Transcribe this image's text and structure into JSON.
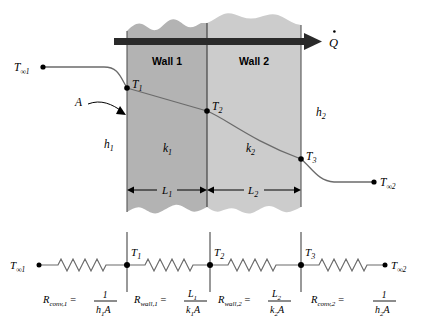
{
  "figure": {
    "type": "thermal-resistance-diagram",
    "heat_flow_symbol": "Q",
    "area_label": "A"
  },
  "walls": {
    "wall1": {
      "name": "Wall 1",
      "conductivity_label": "k",
      "conductivity_sub": "1",
      "thickness_label": "L",
      "thickness_sub": "1",
      "fill": "#b3b3b3"
    },
    "wall2": {
      "name": "Wall 2",
      "conductivity_label": "k",
      "conductivity_sub": "2",
      "thickness_label": "L",
      "thickness_sub": "2",
      "fill": "#cccccc"
    }
  },
  "convection": {
    "left": {
      "h_label": "h",
      "h_sub": "1"
    },
    "right": {
      "h_label": "h",
      "h_sub": "2"
    }
  },
  "temperatures": {
    "t_inf1": {
      "base": "T",
      "sub": "∞1"
    },
    "t1": {
      "base": "T",
      "sub": "1"
    },
    "t2": {
      "base": "T",
      "sub": "2"
    },
    "t3": {
      "base": "T",
      "sub": "3"
    },
    "t_inf2": {
      "base": "T",
      "sub": "∞2"
    }
  },
  "network": {
    "nodes": [
      {
        "id": "t_inf1",
        "base": "T",
        "sub": "∞1"
      },
      {
        "id": "t1",
        "base": "T",
        "sub": "1"
      },
      {
        "id": "t2",
        "base": "T",
        "sub": "2"
      },
      {
        "id": "t3",
        "base": "T",
        "sub": "3"
      },
      {
        "id": "t_inf2",
        "base": "T",
        "sub": "∞2"
      }
    ],
    "resistors": [
      {
        "id": "r-conv-1",
        "symbol": "R",
        "symbol_sub": "conv,1",
        "equals": "=",
        "numerator": "1",
        "denominator_base": "h",
        "denominator_sub": "1",
        "denominator_tail": "A"
      },
      {
        "id": "r-wall-1",
        "symbol": "R",
        "symbol_sub": "wall,1",
        "equals": "=",
        "numerator": "L",
        "numerator_sub": "1",
        "denominator_base": "k",
        "denominator_sub": "1",
        "denominator_tail": "A"
      },
      {
        "id": "r-wall-2",
        "symbol": "R",
        "symbol_sub": "wall,2",
        "equals": "=",
        "numerator": "L",
        "numerator_sub": "2",
        "denominator_base": "k",
        "denominator_sub": "2",
        "denominator_tail": "A"
      },
      {
        "id": "r-conv-2",
        "symbol": "R",
        "symbol_sub": "conv,2",
        "equals": "=",
        "numerator": "1",
        "denominator_base": "h",
        "denominator_sub": "2",
        "denominator_tail": "A"
      }
    ]
  },
  "colors": {
    "wall1": "#b3b3b3",
    "wall2": "#cccccc",
    "arrow": "#2a2a2a",
    "line": "#6b6b6b",
    "divider": "#555555",
    "background": "#ffffff"
  }
}
